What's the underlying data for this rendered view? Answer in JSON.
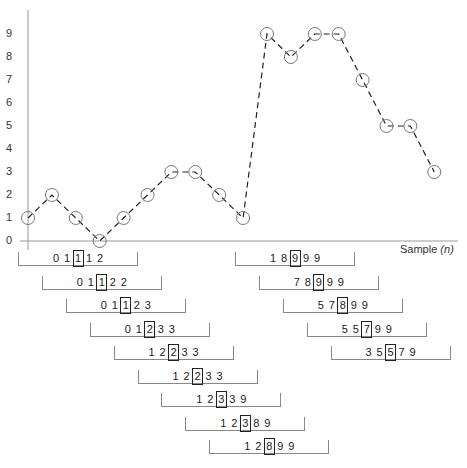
{
  "chart_data": {
    "type": "line",
    "title": "",
    "xlabel": "Sample (n)",
    "ylabel": "",
    "yticks": [
      "0",
      "1",
      "2",
      "3",
      "4",
      "5",
      "6",
      "7",
      "8",
      "9"
    ],
    "ylim": [
      0,
      9
    ],
    "grid": false,
    "legend": null,
    "style": "dashed line with open circle markers",
    "x": [
      0,
      1,
      2,
      3,
      4,
      5,
      6,
      7,
      8,
      9,
      10,
      11,
      12,
      13,
      14,
      15,
      16,
      17
    ],
    "values": [
      1,
      2,
      1,
      0,
      1,
      2,
      3,
      3,
      2,
      1,
      9,
      8,
      9,
      9,
      7,
      5,
      5,
      3
    ]
  },
  "axis": {
    "xlabel_main": "Sample",
    "xlabel_var": "(n)"
  },
  "windows_left": [
    {
      "values": [
        "0",
        "1",
        "1",
        "1",
        "2"
      ],
      "median_index": 2
    },
    {
      "values": [
        "0",
        "1",
        "1",
        "2",
        "2"
      ],
      "median_index": 2
    },
    {
      "values": [
        "0",
        "1",
        "1",
        "2",
        "3"
      ],
      "median_index": 2
    },
    {
      "values": [
        "0",
        "1",
        "2",
        "3",
        "3"
      ],
      "median_index": 2
    },
    {
      "values": [
        "1",
        "2",
        "2",
        "3",
        "3"
      ],
      "median_index": 2
    },
    {
      "values": [
        "1",
        "2",
        "2",
        "3",
        "3"
      ],
      "median_index": 2
    },
    {
      "values": [
        "1",
        "2",
        "3",
        "3",
        "9"
      ],
      "median_index": 2
    },
    {
      "values": [
        "1",
        "2",
        "3",
        "8",
        "9"
      ],
      "median_index": 2
    },
    {
      "values": [
        "1",
        "2",
        "8",
        "9",
        "9"
      ],
      "median_index": 2
    }
  ],
  "windows_right": [
    {
      "values": [
        "1",
        "8",
        "9",
        "9",
        "9"
      ],
      "median_index": 2
    },
    {
      "values": [
        "7",
        "8",
        "9",
        "9",
        "9"
      ],
      "median_index": 2
    },
    {
      "values": [
        "5",
        "7",
        "8",
        "9",
        "9"
      ],
      "median_index": 2
    },
    {
      "values": [
        "5",
        "5",
        "7",
        "9",
        "9"
      ],
      "median_index": 2
    },
    {
      "values": [
        "3",
        "5",
        "5",
        "7",
        "9"
      ],
      "median_index": 2
    }
  ]
}
